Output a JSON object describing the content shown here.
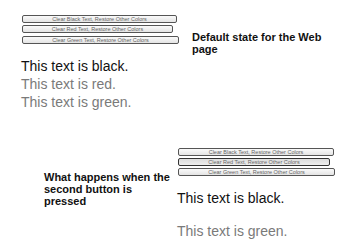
{
  "default_state": {
    "buttons": [
      {
        "label": "Clear Black Text, Restore Other Colors"
      },
      {
        "label": "Clear Red Text, Restore Other Colors"
      },
      {
        "label": "Clear Green Text, Restore Other Colors"
      }
    ],
    "texts": [
      {
        "label": "This text is black.",
        "color": "#111111"
      },
      {
        "label": "This text is red.",
        "color": "#7a7a7a"
      },
      {
        "label": "This text is green.",
        "color": "#7a7a7a"
      }
    ],
    "caption": "Default state for the Web page"
  },
  "pressed_state": {
    "buttons": [
      {
        "label": "Clear Black Text, Restore Other Colors"
      },
      {
        "label": "Clear Red Text, Restore Other Colors"
      },
      {
        "label": "Clear Green Text, Restore Other Colors"
      }
    ],
    "texts": [
      {
        "label": "This text is black.",
        "color": "#111111"
      },
      {
        "label": "This text is green.",
        "color": "#7a7a7a"
      }
    ],
    "caption": "What happens when the second button is pressed"
  }
}
